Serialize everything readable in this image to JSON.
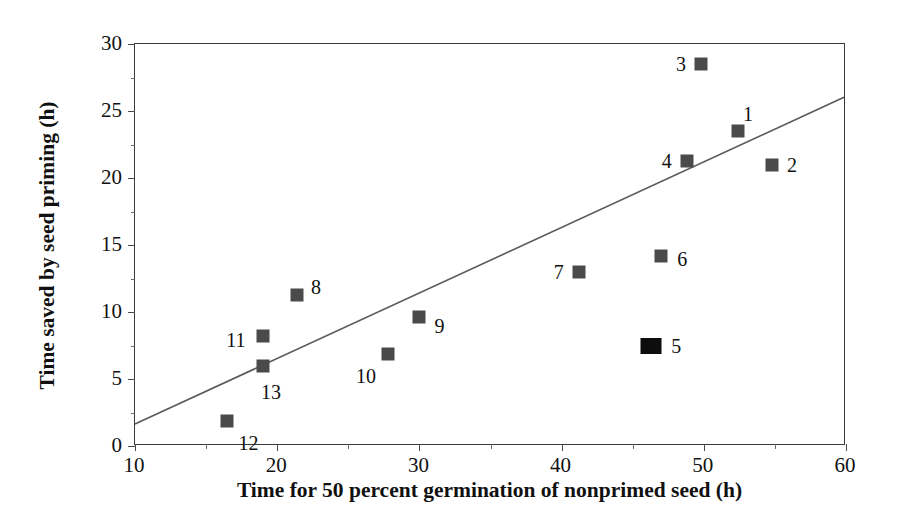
{
  "chart_data": {
    "type": "scatter",
    "title": "",
    "xlabel": "Time for 50 percent germination of nonprimed seed (h)",
    "ylabel": "Time saved by seed priming (h)",
    "xlim": [
      10,
      60
    ],
    "ylim": [
      0,
      30
    ],
    "xticks": [
      10,
      20,
      30,
      40,
      50,
      60
    ],
    "yticks": [
      0,
      5,
      10,
      15,
      20,
      25,
      30
    ],
    "xminor": [
      15,
      25,
      35,
      45,
      55
    ],
    "yminor": [
      2.5,
      7.5,
      12.5,
      17.5,
      22.5,
      27.5
    ],
    "grid": false,
    "legend": "none",
    "marker_color": "#4a4a4a",
    "highlight_color": "#0d0d0d",
    "points": [
      {
        "label": "1",
        "x": 52.4,
        "y": 23.5,
        "label_dx": 10,
        "label_dy": -17,
        "size": "normal"
      },
      {
        "label": "2",
        "x": 54.8,
        "y": 21.0,
        "label_dx": 20,
        "label_dy": 0,
        "size": "normal"
      },
      {
        "label": "3",
        "x": 49.8,
        "y": 28.5,
        "label_dx": -20,
        "label_dy": 0,
        "size": "normal"
      },
      {
        "label": "4",
        "x": 48.8,
        "y": 21.3,
        "label_dx": -20,
        "label_dy": 0,
        "size": "normal"
      },
      {
        "label": "5",
        "x": 46.3,
        "y": 7.5,
        "label_dx": 25,
        "label_dy": 0,
        "size": "big"
      },
      {
        "label": "6",
        "x": 47.0,
        "y": 14.2,
        "label_dx": 21,
        "label_dy": 3,
        "size": "normal"
      },
      {
        "label": "7",
        "x": 41.2,
        "y": 13.0,
        "label_dx": -20,
        "label_dy": 0,
        "size": "normal"
      },
      {
        "label": "8",
        "x": 21.4,
        "y": 11.3,
        "label_dx": 19,
        "label_dy": -8,
        "size": "normal"
      },
      {
        "label": "9",
        "x": 30.0,
        "y": 9.6,
        "label_dx": 20,
        "label_dy": 9,
        "size": "normal"
      },
      {
        "label": "10",
        "x": 27.8,
        "y": 6.9,
        "label_dx": -22,
        "label_dy": 22,
        "size": "normal"
      },
      {
        "label": "11",
        "x": 19.0,
        "y": 8.2,
        "label_dx": -27,
        "label_dy": 4,
        "size": "normal"
      },
      {
        "label": "12",
        "x": 16.5,
        "y": 1.9,
        "label_dx": 21,
        "label_dy": 22,
        "size": "normal"
      },
      {
        "label": "13",
        "x": 19.0,
        "y": 6.0,
        "label_dx": 8,
        "label_dy": 26,
        "size": "normal"
      }
    ],
    "trendline": {
      "x0": 10,
      "y0": 1.5,
      "x1": 60,
      "y1": 26.0,
      "color": "#5a5a5a"
    }
  }
}
